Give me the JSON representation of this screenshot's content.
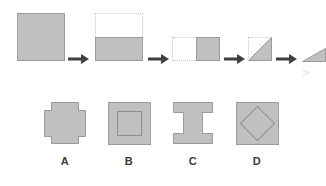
{
  "figure": {
    "background_color": "#ffffff",
    "fill_color": "#c0c0c0",
    "stroke_color": "#9a9a9a",
    "ghost_stroke_color": "#c8c8c8",
    "arrow_color": "#404040",
    "label_color": "#3a3a3a"
  },
  "sequence": {
    "name": "fold-sequence",
    "arrow_glyph": "→",
    "steps": [
      {
        "id": "step-1",
        "name": "unfolded-square",
        "description": "full solid square",
        "shape": "square",
        "filled": true,
        "ghost": false
      },
      {
        "id": "step-2",
        "name": "fold-bottom-half",
        "description": "square folded in half upward to lower half, ghost outline of original above",
        "shape": "rectangle-bottom-half",
        "filled": true,
        "ghost": true
      },
      {
        "id": "step-3",
        "name": "fold-right-half",
        "description": "folded again to right half, ghost outline of previous at left",
        "shape": "square-right-half",
        "filled": true,
        "ghost": true
      },
      {
        "id": "step-4",
        "name": "fold-diagonal",
        "description": "folded along diagonal into triangle, ghost square outline behind",
        "shape": "triangle-lower-right",
        "filled": true,
        "ghost": true
      },
      {
        "id": "step-5",
        "name": "folded-result-cropped",
        "description": "final folded triangle, cropped at right edge of image",
        "shape": "triangle-clipped",
        "filled": true,
        "ghost": false
      }
    ],
    "arrows": [
      {
        "id": "arrow-1",
        "name": "sequence-arrow-1"
      },
      {
        "id": "arrow-2",
        "name": "sequence-arrow-2"
      },
      {
        "id": "arrow-3",
        "name": "sequence-arrow-3"
      },
      {
        "id": "arrow-4",
        "name": "sequence-arrow-4"
      }
    ],
    "stray_mark": ">"
  },
  "options": [
    {
      "id": "option-a",
      "label": "A",
      "name": "answer-option-a",
      "description": "square with small notches cut from all four corners forming a plus/cross silhouette",
      "shape": "cross-notched-square"
    },
    {
      "id": "option-b",
      "label": "B",
      "name": "answer-option-b",
      "description": "solid square with a smaller square outline centered inside",
      "shape": "square-with-inner-square"
    },
    {
      "id": "option-c",
      "label": "C",
      "name": "answer-option-c",
      "description": "square with rectangular notches cut from the left and right middle edges forming an I-beam",
      "shape": "i-beam-square"
    },
    {
      "id": "option-d",
      "label": "D",
      "name": "answer-option-d",
      "description": "solid square with a diamond (rotated square) outline centered inside",
      "shape": "square-with-inner-diamond"
    }
  ]
}
